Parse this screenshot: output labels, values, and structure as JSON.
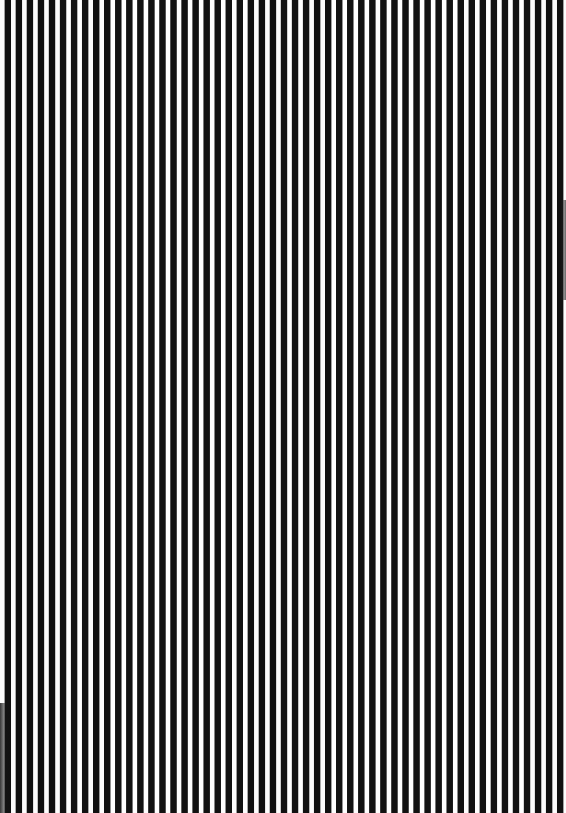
{
  "image": {
    "subject": "Black and white vertical stripe pattern",
    "stripe_orientation": "vertical",
    "colors": {
      "dark": "#111111",
      "light": "#fdfdfd"
    },
    "stripe_period_px": 11,
    "approx_dark_stripe_count": 51
  }
}
